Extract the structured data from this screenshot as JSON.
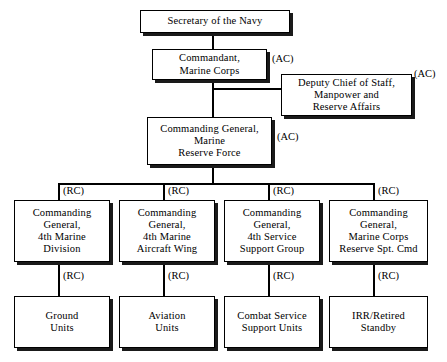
{
  "diagram": {
    "colors": {
      "ink": "#000000",
      "background": "#ffffff",
      "shadow": "#1a1a1a"
    },
    "nodes": {
      "secretary": {
        "label": "Secretary of the Navy"
      },
      "commandant": {
        "label": "Commandant,\nMarine Corps"
      },
      "deputy_chief": {
        "label": "Deputy Chief of Staff,\nManpower and\nReserve Affairs"
      },
      "cg_reserve": {
        "label": "Commanding General,\nMarine\nReserve Force"
      },
      "cg_4th_div": {
        "label": "Commanding\nGeneral,\n4th Marine\nDivision"
      },
      "cg_4th_maw": {
        "label": "Commanding\nGeneral,\n4th Marine\nAircraft Wing"
      },
      "cg_4th_fssg": {
        "label": "Commanding\nGeneral,\n4th Service\nSupport Group"
      },
      "cg_mcrsc": {
        "label": "Commanding\nGeneral,\nMarine Corps\nReserve Spt. Cmd"
      },
      "ground_units": {
        "label": "Ground\nUnits"
      },
      "aviation_units": {
        "label": "Aviation\nUnits"
      },
      "css_units": {
        "label": "Combat Service\nSupport Units"
      },
      "irr_standby": {
        "label": "IRR/Retired\nStandby"
      }
    },
    "tags": {
      "ac_commandant": "(AC)",
      "ac_deputy": "(AC)",
      "ac_cg_reserve": "(AC)",
      "rc_div": "(RC)",
      "rc_maw": "(RC)",
      "rc_fssg": "(RC)",
      "rc_mcrsc": "(RC)",
      "rc_ground": "(RC)",
      "rc_aviation": "(RC)",
      "rc_css": "(RC)",
      "rc_irr": "(RC)"
    }
  }
}
